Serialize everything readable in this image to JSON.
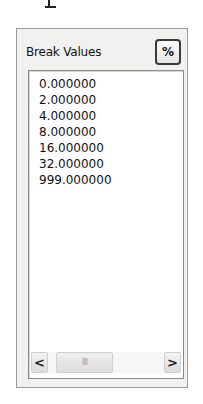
{
  "panel": {
    "title": "Break Values",
    "percent_button": {
      "label": "%",
      "icon": "percent-icon"
    }
  },
  "list": {
    "items": [
      "0.000000",
      "2.000000",
      "4.000000",
      "8.000000",
      "16.000000",
      "32.000000",
      "999.000000"
    ]
  },
  "scrollbar": {
    "left_arrow": "<",
    "right_arrow": ">",
    "thumb_grip": "IIII"
  }
}
